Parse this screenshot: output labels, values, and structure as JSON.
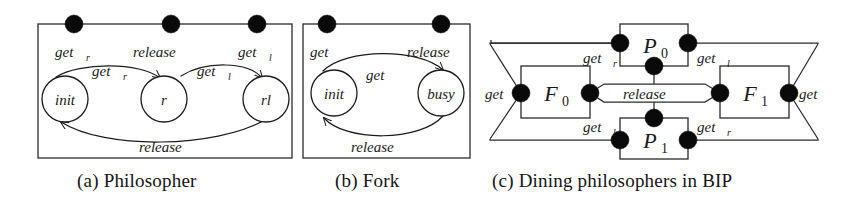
{
  "figure": {
    "background": "#ffffff",
    "ink": "#1c1c1c"
  },
  "panels": [
    {
      "id": "a",
      "caption": "(a) Philosopher",
      "ports": [
        {
          "name": "get-r-port",
          "label": "get",
          "sub": "r"
        },
        {
          "name": "release-port",
          "label": "release",
          "sub": ""
        },
        {
          "name": "get-l-port",
          "label": "get",
          "sub": "l"
        }
      ],
      "states": [
        {
          "name": "state-init",
          "label": "init"
        },
        {
          "name": "state-r",
          "label": "r"
        },
        {
          "name": "state-rl",
          "label": "rl"
        }
      ],
      "transitions": [
        {
          "name": "transition-get-r",
          "label": "get",
          "sub": "r",
          "from": "init",
          "to": "r"
        },
        {
          "name": "transition-get-l",
          "label": "get",
          "sub": "l",
          "from": "r",
          "to": "rl"
        },
        {
          "name": "transition-release",
          "label": "release",
          "sub": "",
          "from": "rl",
          "to": "init"
        }
      ]
    },
    {
      "id": "b",
      "caption": "(b) Fork",
      "ports": [
        {
          "name": "get-port",
          "label": "get",
          "sub": ""
        },
        {
          "name": "release-port",
          "label": "release",
          "sub": ""
        }
      ],
      "states": [
        {
          "name": "state-init",
          "label": "init"
        },
        {
          "name": "state-busy",
          "label": "busy"
        }
      ],
      "transitions": [
        {
          "name": "transition-get",
          "label": "get",
          "sub": "",
          "from": "init",
          "to": "busy"
        },
        {
          "name": "transition-release",
          "label": "release",
          "sub": "",
          "from": "busy",
          "to": "init"
        }
      ]
    },
    {
      "id": "c",
      "caption": "(c) Dining philosophers in BIP",
      "components": [
        {
          "name": "component-p0",
          "label": "P",
          "sub": "0"
        },
        {
          "name": "component-p1",
          "label": "P",
          "sub": "1"
        },
        {
          "name": "component-f0",
          "label": "F",
          "sub": "0"
        },
        {
          "name": "component-f1",
          "label": "F",
          "sub": "1"
        }
      ],
      "connector_labels": [
        {
          "name": "connector-label-get-r-top",
          "label": "get",
          "sub": "r"
        },
        {
          "name": "connector-label-get-l-top",
          "label": "get",
          "sub": "l"
        },
        {
          "name": "connector-label-get-left",
          "label": "get",
          "sub": ""
        },
        {
          "name": "connector-label-release-mid",
          "label": "release",
          "sub": ""
        },
        {
          "name": "connector-label-get-right",
          "label": "get",
          "sub": ""
        },
        {
          "name": "connector-label-get-l-bottom",
          "label": "get",
          "sub": "l"
        },
        {
          "name": "connector-label-get-r-bottom",
          "label": "get",
          "sub": "r"
        }
      ]
    }
  ]
}
